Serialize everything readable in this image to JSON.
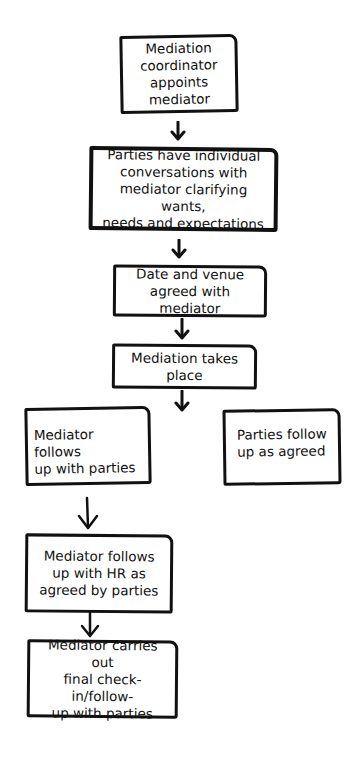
{
  "diagram": {
    "type": "flowchart",
    "nodes": [
      {
        "id": "n1",
        "label": "Mediation\ncoordinator\nappoints mediator"
      },
      {
        "id": "n2",
        "label": "Parties have individual\nconversations with\nmediator clarifying wants,\nneeds and expectations"
      },
      {
        "id": "n3",
        "label": "Date and venue\nagreed with mediator"
      },
      {
        "id": "n4",
        "label": "Mediation takes\nplace"
      },
      {
        "id": "n5",
        "label": "Mediator follows\nup with parties"
      },
      {
        "id": "n6",
        "label": "Parties follow\nup as agreed"
      },
      {
        "id": "n7",
        "label": "Mediator follows\nup with HR as\nagreed by parties"
      },
      {
        "id": "n8",
        "label": "Mediator carries out\nfinal check-in/follow-\nup with parties"
      }
    ],
    "edges": [
      {
        "from": "n1",
        "to": "n2"
      },
      {
        "from": "n2",
        "to": "n3"
      },
      {
        "from": "n3",
        "to": "n4"
      },
      {
        "from": "n4",
        "to": "n5"
      },
      {
        "from": "n5",
        "to": "n7"
      },
      {
        "from": "n7",
        "to": "n8"
      }
    ],
    "colors": {
      "stroke": "#111111",
      "background": "#ffffff"
    }
  }
}
